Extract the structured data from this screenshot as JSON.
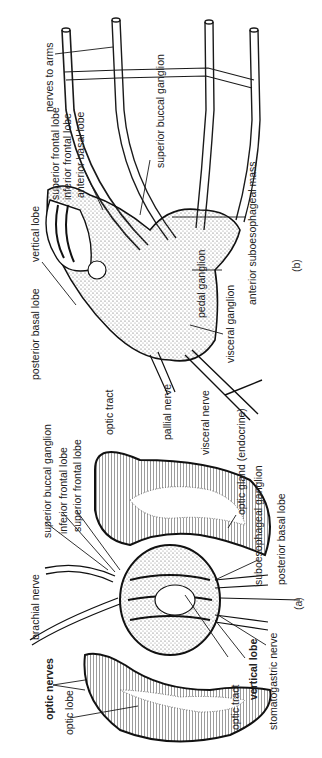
{
  "figure": {
    "orientation": "rotated-90-ccw",
    "panels": [
      {
        "id": "a",
        "tag": "(a)",
        "labels": {
          "brachial_nerve": "brachial nerve",
          "optic_nerves": "optic nerves",
          "optic_lobe": "optic lobe",
          "superior_buccal_ganglion": "superior buccal ganglion",
          "inferior_frontal_lobe": "inferior frontal lobe",
          "superior_frontal_lobe": "superior frontal lobe",
          "optic_tract": "optic tract",
          "vertical_lobe": "vertical lobe",
          "stomatogastric_nerve": "stomatogastric nerve",
          "optic_gland": "optic gland (endocrine)",
          "suboesophageal_ganglion": "suboesophageal ganglion",
          "posterior_basal_lobe": "posterior basal lobe"
        },
        "bold_labels": [
          "optic nerves",
          "vertical lobe"
        ]
      },
      {
        "id": "b",
        "tag": "(b)",
        "labels": {
          "nerves_to_arms": "nerves to arms",
          "superior_buccal_ganglion": "superior buccal ganglion",
          "superior_frontal_lobe": "superior frontal lobe",
          "inferior_frontal_lobe": "inferior frontal lobe",
          "anterior_basal_lobe": "anterior basal lobe",
          "vertical_lobe": "vertical lobe",
          "posterior_basal_lobe": "posterior basal lobe",
          "anterior_suboesophageal_mass": "anterior suboesophageal mass",
          "pedal_ganglion": "pedal ganglion",
          "visceral_ganglion": "visceral ganglion",
          "optic_tract": "optic tract",
          "pallial_nerve": "pallial nerve",
          "visceral_nerve": "visceral nerve"
        }
      }
    ],
    "colors": {
      "ink": "#1a1a1a",
      "background": "#ffffff",
      "stipple": "#555555"
    }
  }
}
